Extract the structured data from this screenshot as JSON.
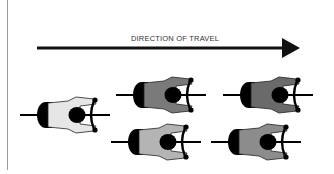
{
  "diagram": {
    "title": "DIRECTION OF TRAVEL",
    "arrow": {
      "x1": 37,
      "x2": 300,
      "y": 48,
      "color": "#111111"
    },
    "cyclists": [
      {
        "id": "leader",
        "cx": 70,
        "cy": 115,
        "body_color": "#e6e6e6"
      },
      {
        "id": "row1-left",
        "cx": 166,
        "cy": 95,
        "body_color": "#7a7a7a"
      },
      {
        "id": "row1-right",
        "cx": 273,
        "cy": 95,
        "body_color": "#6a6a6a"
      },
      {
        "id": "row2-left",
        "cx": 161,
        "cy": 142,
        "body_color": "#b4b4b4"
      },
      {
        "id": "row2-right",
        "cx": 261,
        "cy": 142,
        "body_color": "#8c8c8c"
      }
    ]
  }
}
